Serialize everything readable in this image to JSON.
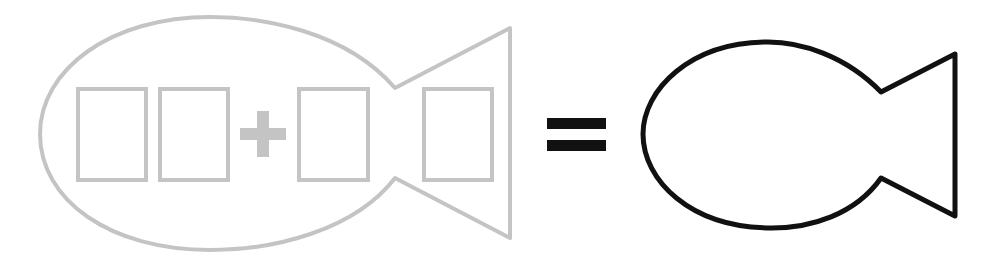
{
  "puzzle": {
    "description": "Fill-in-the-blank addition puzzle shaped like a fish",
    "operator_plus": "+",
    "operator_equals": "=",
    "blank_boxes": [
      "",
      "",
      "",
      ""
    ],
    "result_fish_label": ""
  },
  "colors": {
    "gray_outline": "#c4c4c4",
    "black_outline": "#111111",
    "background": "#ffffff"
  }
}
